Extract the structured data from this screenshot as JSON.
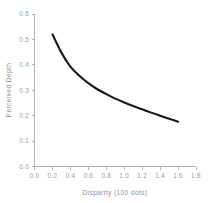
{
  "chart_data": {
    "type": "line",
    "title": "",
    "xlabel": "Disparity (100 dots)",
    "ylabel": "Perceived Depth",
    "xlim": [
      0.0,
      1.8
    ],
    "ylim": [
      0.0,
      0.6
    ],
    "grid": false,
    "legend": null,
    "xticks": [
      "0.0",
      "0.2",
      "0.4",
      "0.6",
      "0.8",
      "1.0",
      "1.2",
      "1.4",
      "1.6",
      "1.8"
    ],
    "xtick_values": [
      0.0,
      0.2,
      0.4,
      0.6,
      0.8,
      1.0,
      1.2,
      1.4,
      1.6,
      1.8
    ],
    "yticks": [
      "0.0",
      "0.1",
      "0.2",
      "0.3",
      "0.4",
      "0.5",
      "0.6"
    ],
    "ytick_values": [
      0.0,
      0.1,
      0.2,
      0.3,
      0.4,
      0.5,
      0.6
    ],
    "series": [
      {
        "name": "Perceived Depth",
        "color": "#1a1a1a",
        "x": [
          0.2,
          0.3,
          0.4,
          0.5,
          0.6,
          0.7,
          0.8,
          0.9,
          1.0,
          1.1,
          1.2,
          1.3,
          1.4,
          1.5,
          1.6
        ],
        "y": [
          0.52,
          0.448,
          0.393,
          0.357,
          0.328,
          0.304,
          0.285,
          0.267,
          0.252,
          0.238,
          0.225,
          0.212,
          0.2,
          0.188,
          0.176
        ]
      }
    ],
    "colors": {
      "background": "#ffffff",
      "axis": "#b3b3b3",
      "tick_label": "#9a9a9a",
      "axis_title": "#8f8f8f",
      "curve": "#1a1a1a"
    }
  }
}
